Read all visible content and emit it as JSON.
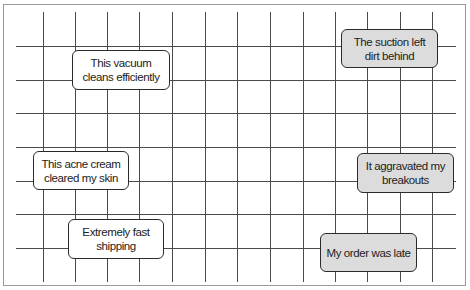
{
  "grid": {
    "vertical_x": [
      43,
      75,
      107,
      139,
      172,
      205,
      237,
      270,
      303,
      335,
      367,
      400,
      432
    ],
    "horizontal_y": [
      46,
      80,
      113,
      147,
      181,
      214,
      248
    ],
    "line_color": "#4a4a4a"
  },
  "colors": {
    "positive_fill": "#ffffff",
    "negative_fill": "#dcdcdc",
    "border": "#2b2b2b"
  },
  "cards": [
    {
      "text": "This vacuum cleans efficiently",
      "sentiment": "positive"
    },
    {
      "text": "The suction left dirt behind",
      "sentiment": "negative"
    },
    {
      "text": "This acne cream cleared my skin",
      "sentiment": "positive"
    },
    {
      "text": "It aggravated my breakouts",
      "sentiment": "negative"
    },
    {
      "text": "Extremely fast shipping",
      "sentiment": "positive"
    },
    {
      "text": "My order was late",
      "sentiment": "negative"
    }
  ]
}
